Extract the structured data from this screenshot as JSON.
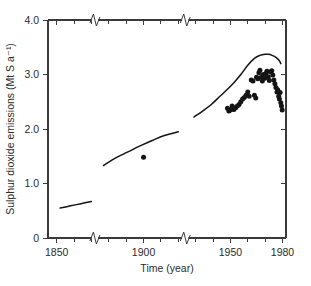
{
  "chart_data": {
    "type": "line",
    "title": "",
    "subtitle": "",
    "xlabel": "Time (year)",
    "ylabel": "Sulphur dioxide emissions (Mt S a⁻¹)",
    "xlim": [
      1845,
      1982
    ],
    "ylim": [
      0,
      4.0
    ],
    "grid": false,
    "legend_position": "none",
    "x_ticks_major": [
      1850,
      1900,
      1950,
      1980
    ],
    "x_tick_labels": [
      "1850",
      "1900",
      "1950",
      "1980"
    ],
    "x_ticks_minor": [
      1860,
      1870,
      1880,
      1890,
      1910,
      1920,
      1930,
      1940,
      1960,
      1970
    ],
    "y_ticks": [
      0,
      1.0,
      2.0,
      3.0,
      4.0
    ],
    "y_tick_labels": [
      "0",
      "1.0",
      "2.0",
      "3.0",
      "4.0"
    ],
    "axis_breaks_x": [
      1872,
      1924
    ],
    "series": [
      {
        "name": "estimated emissions (line segment 1)",
        "kind": "line",
        "x": [
          1852,
          1858,
          1864,
          1870
        ],
        "values": [
          0.55,
          0.59,
          0.63,
          0.67
        ]
      },
      {
        "name": "estimated emissions (line segment 2)",
        "kind": "line",
        "x": [
          1877,
          1884,
          1891,
          1898,
          1905,
          1912,
          1920
        ],
        "values": [
          1.33,
          1.47,
          1.58,
          1.69,
          1.79,
          1.88,
          1.95
        ]
      },
      {
        "name": "estimated emissions (line segment 3)",
        "kind": "line",
        "x": [
          1929,
          1934,
          1939,
          1944,
          1948,
          1952,
          1956,
          1960,
          1964,
          1967,
          1970,
          1972,
          1974,
          1976,
          1978,
          1979
        ],
        "values": [
          2.22,
          2.33,
          2.45,
          2.6,
          2.72,
          2.85,
          3.0,
          3.17,
          3.3,
          3.35,
          3.37,
          3.37,
          3.35,
          3.32,
          3.26,
          3.2
        ]
      },
      {
        "name": "measured emissions (scatter)",
        "kind": "scatter",
        "points": [
          [
            1900.0,
            1.48
          ],
          [
            1948.3,
            2.38
          ],
          [
            1949.1,
            2.33
          ],
          [
            1950.0,
            2.35
          ],
          [
            1951.0,
            2.42
          ],
          [
            1952.0,
            2.36
          ],
          [
            1953.0,
            2.39
          ],
          [
            1954.0,
            2.42
          ],
          [
            1955.0,
            2.45
          ],
          [
            1956.0,
            2.5
          ],
          [
            1957.0,
            2.55
          ],
          [
            1958.0,
            2.58
          ],
          [
            1959.0,
            2.62
          ],
          [
            1960.0,
            2.68
          ],
          [
            1960.8,
            2.6
          ],
          [
            1962.0,
            2.9
          ],
          [
            1963.0,
            2.88
          ],
          [
            1963.8,
            2.62
          ],
          [
            1964.6,
            2.57
          ],
          [
            1965.0,
            2.95
          ],
          [
            1965.8,
            2.92
          ],
          [
            1966.4,
            3.03
          ],
          [
            1967.0,
            3.08
          ],
          [
            1967.8,
            2.95
          ],
          [
            1968.4,
            2.88
          ],
          [
            1969.0,
            3.0
          ],
          [
            1969.8,
            2.93
          ],
          [
            1970.4,
            3.02
          ],
          [
            1971.0,
            3.06
          ],
          [
            1971.8,
            2.96
          ],
          [
            1972.4,
            2.89
          ],
          [
            1973.0,
            3.05
          ],
          [
            1973.8,
            3.07
          ],
          [
            1974.4,
            2.99
          ],
          [
            1975.0,
            2.9
          ],
          [
            1975.6,
            2.83
          ],
          [
            1976.2,
            2.76
          ],
          [
            1976.8,
            2.68
          ],
          [
            1977.2,
            2.72
          ],
          [
            1977.8,
            2.6
          ],
          [
            1978.2,
            2.55
          ],
          [
            1978.6,
            2.67
          ],
          [
            1979.0,
            2.48
          ],
          [
            1979.4,
            2.42
          ],
          [
            1979.8,
            2.35
          ]
        ]
      }
    ]
  }
}
